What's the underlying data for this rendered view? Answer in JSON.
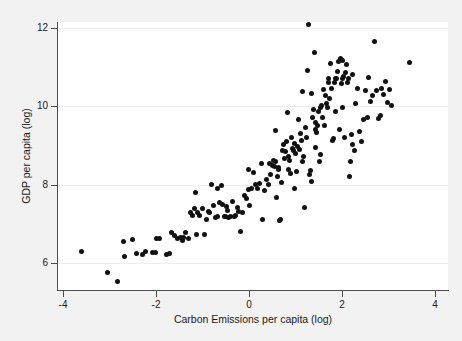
{
  "chart_data": {
    "type": "scatter",
    "title": "",
    "xlabel": "Carbon Emissions per capita (log)",
    "ylabel": "GDP per capita (log)",
    "xlim": [
      -4.2,
      4.2
    ],
    "ylim": [
      5.3,
      12.3
    ],
    "xticks": [
      -4,
      -2,
      0,
      2,
      4
    ],
    "xtick_labels": [
      "-4",
      "-2",
      "0",
      "2",
      "4"
    ],
    "yticks": [
      6,
      8,
      10,
      12
    ],
    "ytick_labels": [
      "6",
      "8",
      "10",
      "12"
    ],
    "grid": "horizontal-faint",
    "legend": "none",
    "marker_color": "#111111",
    "panel_color": "#ffffff",
    "background_color": "#f2f2f2",
    "axis_color": "#4d4d4d",
    "n_points": 186,
    "series": [
      {
        "name": "countries",
        "points": [
          [
            -3.6,
            6.3
          ],
          [
            -3.05,
            5.75
          ],
          [
            -2.83,
            5.52
          ],
          [
            -2.7,
            6.56
          ],
          [
            -2.68,
            6.17
          ],
          [
            -2.5,
            6.6
          ],
          [
            -2.42,
            6.25
          ],
          [
            -2.3,
            6.22
          ],
          [
            -2.22,
            6.3
          ],
          [
            -2.08,
            6.27
          ],
          [
            -2.02,
            6.28
          ],
          [
            -1.98,
            6.62
          ],
          [
            -1.92,
            6.63
          ],
          [
            -1.78,
            6.22
          ],
          [
            -1.7,
            6.24
          ],
          [
            -1.66,
            6.78
          ],
          [
            -1.6,
            6.7
          ],
          [
            -1.54,
            6.62
          ],
          [
            -1.48,
            6.66
          ],
          [
            -1.44,
            6.58
          ],
          [
            -1.4,
            6.64
          ],
          [
            -1.36,
            6.78
          ],
          [
            -1.3,
            6.62
          ],
          [
            -1.26,
            7.3
          ],
          [
            -1.22,
            7.22
          ],
          [
            -1.18,
            7.38
          ],
          [
            -1.14,
            7.8
          ],
          [
            -1.1,
            7.3
          ],
          [
            -1.06,
            7.22
          ],
          [
            -1.0,
            7.4
          ],
          [
            -0.96,
            6.72
          ],
          [
            -0.92,
            7.12
          ],
          [
            -0.88,
            7.32
          ],
          [
            -0.84,
            7.28
          ],
          [
            -0.8,
            8.0
          ],
          [
            -0.76,
            7.48
          ],
          [
            -0.72,
            7.16
          ],
          [
            -0.68,
            7.18
          ],
          [
            -0.64,
            7.54
          ],
          [
            -0.6,
            7.98
          ],
          [
            -0.56,
            7.5
          ],
          [
            -0.52,
            7.2
          ],
          [
            -0.5,
            7.2
          ],
          [
            -0.48,
            7.44
          ],
          [
            -0.46,
            7.34
          ],
          [
            -0.44,
            7.16
          ],
          [
            -0.4,
            7.18
          ],
          [
            -0.36,
            7.58
          ],
          [
            -0.32,
            7.18
          ],
          [
            -0.28,
            7.22
          ],
          [
            -0.24,
            7.42
          ],
          [
            -0.22,
            7.32
          ],
          [
            -0.18,
            6.8
          ],
          [
            -0.14,
            7.28
          ],
          [
            -0.1,
            7.72
          ],
          [
            -0.06,
            7.64
          ],
          [
            -0.02,
            7.88
          ],
          [
            0.02,
            7.46
          ],
          [
            0.06,
            7.9
          ],
          [
            0.1,
            8.3
          ],
          [
            0.14,
            8.0
          ],
          [
            0.18,
            7.9
          ],
          [
            0.22,
            8.02
          ],
          [
            0.26,
            8.54
          ],
          [
            0.3,
            7.12
          ],
          [
            0.34,
            7.86
          ],
          [
            0.38,
            8.14
          ],
          [
            0.42,
            8.0
          ],
          [
            0.46,
            8.26
          ],
          [
            0.5,
            8.5
          ],
          [
            0.52,
            8.62
          ],
          [
            0.54,
            8.46
          ],
          [
            0.56,
            8.58
          ],
          [
            0.58,
            9.38
          ],
          [
            0.6,
            7.66
          ],
          [
            0.62,
            8.22
          ],
          [
            0.64,
            8.4
          ],
          [
            0.66,
            7.08
          ],
          [
            0.68,
            7.1
          ],
          [
            0.7,
            8.06
          ],
          [
            0.72,
            8.86
          ],
          [
            0.74,
            9.02
          ],
          [
            0.76,
            8.66
          ],
          [
            0.78,
            8.84
          ],
          [
            0.8,
            9.1
          ],
          [
            0.82,
            9.84
          ],
          [
            0.84,
            8.72
          ],
          [
            0.86,
            8.4
          ],
          [
            0.88,
            8.62
          ],
          [
            0.9,
            8.28
          ],
          [
            0.92,
            9.2
          ],
          [
            0.94,
            8.92
          ],
          [
            0.96,
            8.88
          ],
          [
            0.98,
            7.9
          ],
          [
            1.0,
            8.8
          ],
          [
            1.02,
            8.34
          ],
          [
            1.04,
            8.98
          ],
          [
            1.06,
            9.66
          ],
          [
            1.08,
            8.9
          ],
          [
            1.1,
            9.3
          ],
          [
            1.12,
            9.14
          ],
          [
            1.14,
            8.6
          ],
          [
            1.16,
            10.38
          ],
          [
            1.18,
            8.72
          ],
          [
            1.2,
            7.42
          ],
          [
            1.22,
            9.46
          ],
          [
            1.24,
            9.2
          ],
          [
            1.26,
            10.92
          ],
          [
            1.28,
            12.1
          ],
          [
            1.3,
            8.26
          ],
          [
            1.32,
            8.36
          ],
          [
            1.34,
            8.08
          ],
          [
            1.36,
            9.72
          ],
          [
            1.38,
            9.92
          ],
          [
            1.4,
            11.38
          ],
          [
            1.42,
            9.42
          ],
          [
            1.44,
            9.6
          ],
          [
            1.46,
            9.34
          ],
          [
            1.48,
            9.52
          ],
          [
            1.5,
            9.88
          ],
          [
            1.52,
            8.6
          ],
          [
            1.54,
            9.96
          ],
          [
            1.56,
            10.02
          ],
          [
            1.58,
            9.72
          ],
          [
            1.6,
            10.44
          ],
          [
            1.62,
            9.5
          ],
          [
            1.64,
            10.28
          ],
          [
            1.66,
            10.08
          ],
          [
            1.68,
            9.96
          ],
          [
            1.7,
            10.7
          ],
          [
            1.72,
            10.6
          ],
          [
            1.74,
            10.2
          ],
          [
            1.76,
            11.1
          ],
          [
            1.78,
            10.46
          ],
          [
            1.8,
            9.12
          ],
          [
            1.82,
            9.18
          ],
          [
            1.84,
            10.62
          ],
          [
            1.86,
            10.72
          ],
          [
            1.88,
            10.7
          ],
          [
            1.9,
            10.9
          ],
          [
            1.92,
            11.14
          ],
          [
            1.94,
            9.42
          ],
          [
            1.96,
            11.22
          ],
          [
            1.98,
            10.58
          ],
          [
            2.0,
            11.18
          ],
          [
            2.02,
            10.7
          ],
          [
            2.04,
            10.76
          ],
          [
            2.06,
            9.2
          ],
          [
            2.08,
            10.86
          ],
          [
            2.1,
            11.08
          ],
          [
            2.12,
            10.62
          ],
          [
            2.14,
            10.72
          ],
          [
            2.16,
            8.22
          ],
          [
            2.18,
            8.6
          ],
          [
            2.2,
            9.28
          ],
          [
            2.22,
            9.02
          ],
          [
            2.26,
            8.88
          ],
          [
            2.3,
            10.06
          ],
          [
            2.34,
            10.46
          ],
          [
            2.38,
            9.36
          ],
          [
            2.42,
            9.1
          ],
          [
            2.46,
            9.66
          ],
          [
            2.5,
            10.4
          ],
          [
            2.54,
            9.72
          ],
          [
            2.58,
            10.74
          ],
          [
            2.62,
            10.12
          ],
          [
            2.66,
            10.28
          ],
          [
            2.7,
            11.66
          ],
          [
            2.74,
            10.4
          ],
          [
            2.78,
            9.7
          ],
          [
            2.82,
            9.76
          ],
          [
            2.86,
            10.46
          ],
          [
            2.9,
            10.3
          ],
          [
            2.94,
            10.64
          ],
          [
            2.98,
            10.1
          ],
          [
            3.02,
            10.44
          ],
          [
            3.06,
            10.02
          ],
          [
            3.46,
            11.12
          ],
          [
            -1.12,
            6.74
          ],
          [
            -0.02,
            8.38
          ],
          [
            0.44,
            8.54
          ],
          [
            1.34,
            10.34
          ],
          [
            1.86,
            9.88
          ],
          [
            2.02,
            9.96
          ],
          [
            2.22,
            10.82
          ],
          [
            0.64,
            8.44
          ],
          [
            1.44,
            8.94
          ],
          [
            1.54,
            8.78
          ],
          [
            -0.68,
            7.9
          ],
          [
            0.98,
            9.06
          ]
        ]
      }
    ]
  }
}
